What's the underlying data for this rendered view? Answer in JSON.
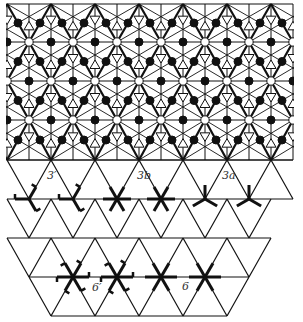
{
  "diagram": {
    "background": "#ffffff",
    "line_color": "#111111",
    "lattice": {
      "dx": 44,
      "dy": 39,
      "x0": 7
    },
    "top_pattern": {
      "rows_y": [
        4,
        42,
        81,
        120,
        160
      ],
      "x_min": 7,
      "x_max": 293
    },
    "bottom_lattice": {
      "rows": [
        {
          "y": 160,
          "x_min": 7,
          "x_max": 293
        },
        {
          "y": 199,
          "x_min": 7,
          "x_max": 293
        },
        {
          "y": 238,
          "x_min": 7,
          "x_max": 271
        },
        {
          "y": 277,
          "x_min": 29,
          "x_max": 249
        },
        {
          "y": 316,
          "x_min": 51,
          "x_max": 227
        }
      ]
    },
    "symbols": [
      {
        "type": "3prime",
        "x": 29,
        "y": 199
      },
      {
        "type": "3prime",
        "x": 73,
        "y": 199
      },
      {
        "type": "3b",
        "x": 117,
        "y": 199
      },
      {
        "type": "3b",
        "x": 161,
        "y": 199
      },
      {
        "type": "3a",
        "x": 205,
        "y": 199
      },
      {
        "type": "3a",
        "x": 249,
        "y": 199
      },
      {
        "type": "6prime",
        "x": 73,
        "y": 277
      },
      {
        "type": "6prime",
        "x": 117,
        "y": 277
      },
      {
        "type": "6",
        "x": 161,
        "y": 277
      },
      {
        "type": "6",
        "x": 205,
        "y": 277
      }
    ],
    "labels": [
      {
        "id": "label-3prime",
        "text": "3′",
        "x": 47,
        "y": 179
      },
      {
        "id": "label-3b",
        "text": "3b",
        "x": 137,
        "y": 179
      },
      {
        "id": "label-3a",
        "text": "3a",
        "x": 222,
        "y": 179
      },
      {
        "id": "label-6prime",
        "text": "6′",
        "x": 92,
        "y": 290
      },
      {
        "id": "label-6",
        "text": "6",
        "x": 181,
        "y": 289
      }
    ]
  }
}
